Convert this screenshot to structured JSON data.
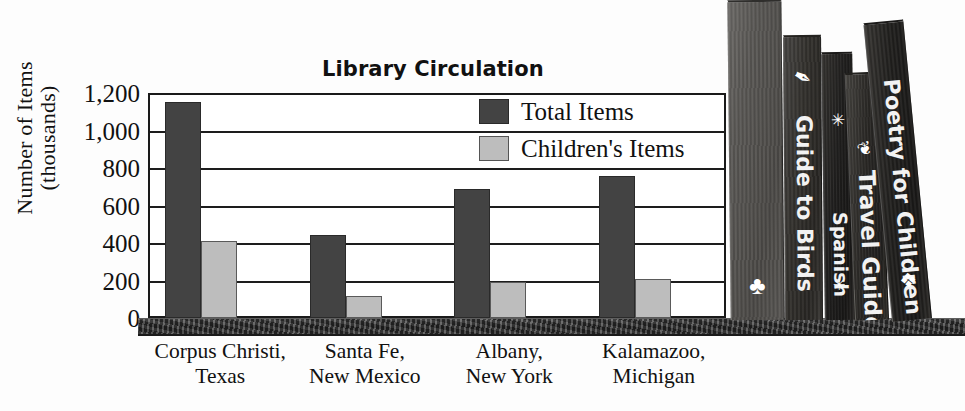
{
  "chart_data": {
    "type": "bar",
    "title": "Library Circulation",
    "xlabel": "",
    "ylabel": "Number of Items (thousands)",
    "ylabel_line1": "Number of Items",
    "ylabel_line2": "(thousands)",
    "ylim": [
      0,
      1200
    ],
    "ytick_labels": [
      "1,200",
      "1,000",
      "800",
      "600",
      "400",
      "200",
      "0"
    ],
    "ytick_values": [
      1200,
      1000,
      800,
      600,
      400,
      200,
      0
    ],
    "grid": true,
    "legend_position": "top-right-inside",
    "categories": [
      "Corpus Christi, Texas",
      "Santa Fe, New Mexico",
      "Albany, New York",
      "Kalamazoo, Michigan"
    ],
    "category_lines": [
      {
        "line1": "Corpus Christi,",
        "line2": "Texas"
      },
      {
        "line1": "Santa Fe,",
        "line2": "New Mexico"
      },
      {
        "line1": "Albany,",
        "line2": "New York"
      },
      {
        "line1": "Kalamazoo,",
        "line2": "Michigan"
      }
    ],
    "series": [
      {
        "name": "Total Items",
        "color": "#434343",
        "values": [
          1150,
          445,
          690,
          755
        ]
      },
      {
        "name": "Children's Items",
        "color": "#bdbdbd",
        "values": [
          410,
          120,
          190,
          210
        ]
      }
    ]
  },
  "legend": {
    "items": [
      {
        "label": "Total Items",
        "swatch": "dark-gray-swatch"
      },
      {
        "label": "Children's Items",
        "swatch": "light-gray-swatch"
      }
    ]
  },
  "decoration": {
    "shelf_name": "bookshelf-ledge",
    "books": [
      {
        "title": "History of the World",
        "ornament": "♣"
      },
      {
        "title": "Guide to Birds",
        "ornament": "🪶"
      },
      {
        "title": "Spanish",
        "ornament": "✳",
        "ornament2": "✳"
      },
      {
        "title": "Travel Guide",
        "ornament": "🌾"
      },
      {
        "title": "Poetry for Children",
        "ornament": "❖"
      }
    ]
  },
  "colors": {
    "total_items": "#434343",
    "childrens_items": "#bdbdbd",
    "axis": "#1a1a1a",
    "background": "#ffffff"
  }
}
